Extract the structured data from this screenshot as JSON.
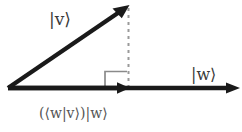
{
  "figure": {
    "background_color": "#ffffff",
    "stroke_color": "#1a1a1a",
    "dashed_color": "#9a9a9a",
    "right_angle_color": "#8a8a8a",
    "label_color": "#3a3a3a"
  },
  "labels": {
    "vector_v": "|v⟩",
    "vector_w": "|w⟩",
    "projection": "(⟨w|v⟩)|w⟩"
  },
  "geometry": {
    "origin": {
      "x": 8,
      "y": 88
    },
    "v_tip": {
      "x": 128,
      "y": 6
    },
    "w_tip": {
      "x": 238,
      "y": 88
    },
    "projection_tip": {
      "x": 128,
      "y": 88
    },
    "dashed_line": {
      "x": 128,
      "y_top": 8,
      "y_bottom": 88
    },
    "right_angle_marker": {
      "x": 105,
      "y": 71,
      "size": 18
    }
  }
}
